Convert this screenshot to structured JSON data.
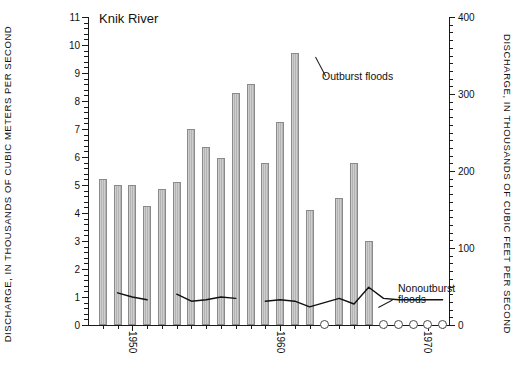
{
  "title": "Knik River",
  "axes": {
    "left_title": "DISCHARGE, IN THOUSANDS OF CUBIC METERS PER SECOND",
    "right_title": "DISCHARGE, IN THOUSANDS OF CUBIC FEET PER SECOND",
    "left_ticks": [
      "0",
      "1",
      "2",
      "3",
      "4",
      "5",
      "6",
      "7",
      "8",
      "9",
      "10",
      "11"
    ],
    "right_ticks": [
      "0",
      "100",
      "200",
      "300",
      "400"
    ],
    "x_ticks": [
      "1950",
      "1960",
      "1970"
    ]
  },
  "annotations": {
    "outburst": "Outburst floods",
    "nonoutburst_line1": "Nonoutburst",
    "nonoutburst_line2": "floods"
  },
  "chart_data": {
    "type": "bar",
    "title": "Knik River",
    "xlabel": "",
    "ylabel": "DISCHARGE, IN THOUSANDS OF CUBIC METERS PER SECOND",
    "ylabel_secondary": "DISCHARGE, IN THOUSANDS OF CUBIC FEET PER SECOND",
    "ylim": [
      0,
      11
    ],
    "ylim_secondary": [
      0,
      400
    ],
    "xlim": [
      1947.0,
      1971.5
    ],
    "grid": false,
    "legend": "annotated in-plot",
    "x": [
      1948,
      1949,
      1950,
      1951,
      1952,
      1953,
      1954,
      1955,
      1956,
      1957,
      1958,
      1959,
      1960,
      1961,
      1962,
      1963,
      1964,
      1965,
      1966,
      1967,
      1968,
      1969,
      1970,
      1971
    ],
    "series": [
      {
        "name": "Outburst floods",
        "type": "bar",
        "values": [
          5.2,
          5.0,
          5.0,
          4.25,
          4.85,
          5.1,
          7.0,
          6.35,
          5.95,
          8.3,
          8.6,
          5.8,
          7.25,
          9.7,
          4.1,
          null,
          4.55,
          5.8,
          3.0,
          null,
          null,
          null,
          null,
          null
        ]
      },
      {
        "name": "Nonoutburst floods",
        "type": "line",
        "values": [
          null,
          1.15,
          1.0,
          0.9,
          null,
          1.1,
          0.85,
          0.9,
          1.0,
          0.95,
          null,
          0.85,
          0.9,
          0.85,
          0.65,
          0.8,
          0.95,
          0.75,
          1.35,
          0.95,
          0.9,
          0.9,
          0.9,
          0.9
        ]
      }
    ],
    "no_outburst_marker_years": [
      1963,
      1967,
      1968,
      1969,
      1970,
      1971
    ],
    "no_outburst_marker_note": "open circle at baseline"
  }
}
